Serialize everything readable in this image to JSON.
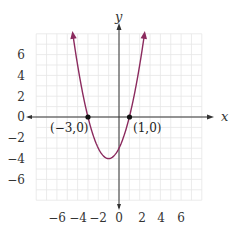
{
  "chart_data": {
    "type": "line",
    "title": "",
    "function": "y = x^2 + 2x - 3",
    "xlabel": "x",
    "ylabel": "y",
    "xlim": [
      -8,
      8
    ],
    "ylim": [
      -8,
      8
    ],
    "grid": true,
    "x_ticks": [
      "-6",
      "-4",
      "-2",
      "0",
      "2",
      "4",
      "6"
    ],
    "y_ticks": [
      "6",
      "4",
      "2",
      "0",
      "-2",
      "-4",
      "-6"
    ],
    "series": [
      {
        "name": "parabola",
        "color": "#8b2a5e",
        "x": [
          -4.6,
          -4,
          -3,
          -2,
          -1,
          0,
          1,
          2,
          2.6
        ],
        "y": [
          4.96,
          5,
          0,
          -3,
          -4,
          -3,
          0,
          5,
          8.96
        ]
      }
    ],
    "vertex": {
      "x": -1,
      "y": -4
    },
    "annotations": [
      {
        "label": "(−3,0)",
        "x": -3,
        "y": 0
      },
      {
        "label": "(1,0)",
        "x": 1,
        "y": 0
      }
    ]
  },
  "labels": {
    "x_axis": "x",
    "y_axis": "y",
    "x_tick_0": "−6",
    "x_tick_1": "−4",
    "x_tick_2": "−2",
    "x_tick_3": "0",
    "x_tick_4": "2",
    "x_tick_5": "4",
    "x_tick_6": "6",
    "y_tick_0": "6",
    "y_tick_1": "4",
    "y_tick_2": "2",
    "y_tick_3": "0",
    "y_tick_4": "−2",
    "y_tick_5": "−4",
    "y_tick_6": "−6",
    "point_left": "(−3,0)",
    "point_right": "(1,0)"
  },
  "colors": {
    "curve": "#8b2a5e",
    "grid": "#e4e4e4",
    "axis": "#333333"
  }
}
